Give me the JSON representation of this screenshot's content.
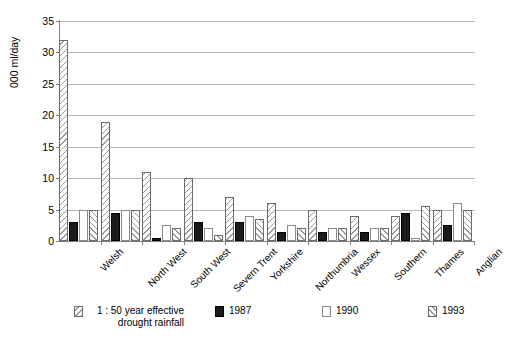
{
  "chart_data": {
    "type": "bar",
    "title": "",
    "xlabel": "",
    "ylabel": "000 ml/day",
    "ylim": [
      0,
      35
    ],
    "ytick_step": 5,
    "yticks": [
      "0",
      "5",
      "10",
      "15",
      "20",
      "25",
      "30",
      "35"
    ],
    "grid": true,
    "legend_position": "bottom",
    "categories": [
      "Welsh",
      "North West",
      "South West",
      "Severn Trent",
      "Yorkshire",
      "Northumbria",
      "Wessex",
      "Southern",
      "Thames",
      "Anglian"
    ],
    "series": [
      {
        "name": "1 : 50  year effective drought rainfall",
        "pattern": "backslash-hatch",
        "color": "#9a9a9a",
        "values": [
          32,
          19,
          11,
          10,
          7,
          6,
          5,
          4,
          4,
          5
        ]
      },
      {
        "name": "1987",
        "pattern": "solid-black",
        "color": "#1a1a1a",
        "values": [
          3,
          4.5,
          0.5,
          3,
          3,
          1.5,
          1.5,
          1.5,
          4.5,
          2.5
        ]
      },
      {
        "name": "1990",
        "pattern": "white-empty",
        "color": "#ffffff",
        "values": [
          5,
          5,
          2.5,
          2,
          4,
          2.5,
          2,
          2,
          0.5,
          6
        ]
      },
      {
        "name": "1993",
        "pattern": "forwardslash-hatch",
        "color": "#9a9a9a",
        "values": [
          5,
          5,
          2,
          1,
          3.5,
          2,
          2,
          2,
          5.5,
          5
        ]
      }
    ]
  },
  "legend": {
    "entries": [
      {
        "label": "1 : 50  year effective drought rainfall",
        "swatch": "backslash-hatch"
      },
      {
        "label": "1987",
        "swatch": "solid-black"
      },
      {
        "label": "1990",
        "swatch": "white-empty"
      },
      {
        "label": "1993",
        "swatch": "forwardslash-hatch"
      }
    ]
  }
}
